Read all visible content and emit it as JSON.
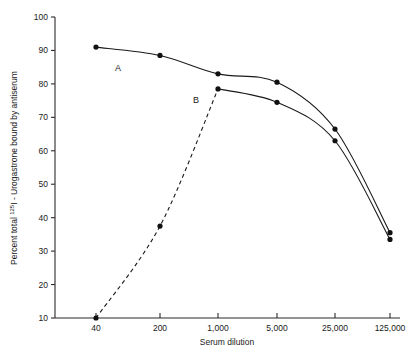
{
  "chart_data": {
    "type": "line",
    "title": "",
    "xlabel": "Serum dilution",
    "ylabel": "Percent total 125I - Urogastrone bound by antiserum",
    "ylabel_parts": {
      "prefix": "Percent total ",
      "isotope_sup": "125",
      "isotope_element": "I",
      "suffix": " - Urogastrone bound by antiserum"
    },
    "x_tick_labels": [
      "40",
      "200",
      "1,000",
      "5,000",
      "25,000",
      "125,000"
    ],
    "x_tick_values": [
      40,
      200,
      1000,
      5000,
      25000,
      125000
    ],
    "y_tick_labels": [
      "10",
      "20",
      "30",
      "40",
      "50",
      "60",
      "70",
      "80",
      "90",
      "100"
    ],
    "y_tick_values": [
      10,
      20,
      30,
      40,
      50,
      60,
      70,
      80,
      90,
      100
    ],
    "ylim": [
      10,
      100
    ],
    "grid": false,
    "legend_position": "inline-annotation",
    "series": [
      {
        "name": "A",
        "label": "A",
        "style": "solid",
        "x": [
          40,
          200,
          1000,
          5000,
          25000,
          125000
        ],
        "values": [
          91,
          88.5,
          83,
          80.5,
          66.5,
          35.5
        ]
      },
      {
        "name": "B",
        "label": "B",
        "style": "dashed-rising-then-solid",
        "x": [
          40,
          200,
          1000,
          5000,
          25000,
          125000
        ],
        "values": [
          10,
          37.5,
          78.5,
          74.5,
          63,
          33.5
        ],
        "dashed_segment_x": [
          40,
          200,
          1000
        ]
      }
    ],
    "annotations": [
      {
        "text": "A",
        "series": "A"
      },
      {
        "text": "B",
        "series": "B"
      }
    ]
  },
  "axes": {
    "x_title": "Serum dilution",
    "y_title": "Percent total 125I - Urogastrone bound by antiserum"
  },
  "colors": {
    "axis": "#2b2b2b",
    "curve": "#1a1a1a",
    "marker": "#111111",
    "background": "#ffffff"
  }
}
